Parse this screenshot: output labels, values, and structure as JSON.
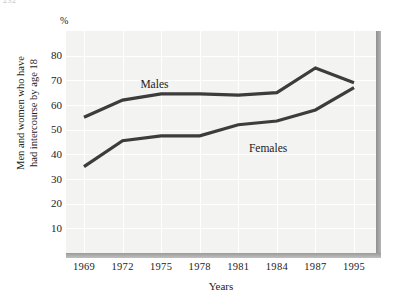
{
  "page": {
    "number": "232"
  },
  "chart_data": {
    "type": "line",
    "title": "",
    "subtitle": "",
    "xlabel": "Years",
    "ylabel": "Men and women who have had intercourse by age 18",
    "ylabel_line1": "Men and women who have",
    "ylabel_line2": "had intercourse by age 18",
    "unit_symbol": "%",
    "categories": [
      "1969",
      "1972",
      "1975",
      "1978",
      "1981",
      "1984",
      "1987",
      "1995"
    ],
    "x": [
      1969,
      1972,
      1975,
      1978,
      1981,
      1984,
      1987,
      1995
    ],
    "ylim": [
      0,
      90
    ],
    "yticks": [
      10,
      20,
      30,
      40,
      50,
      60,
      70,
      80
    ],
    "ytick_labels": [
      "10",
      "20",
      "30",
      "40",
      "50",
      "60",
      "70",
      "80"
    ],
    "grid": true,
    "legend": "inline-annotations",
    "series": [
      {
        "name": "Males",
        "label": "Males",
        "color": "#3c3c3c",
        "values": [
          55,
          62,
          64.5,
          64.5,
          64,
          65,
          75,
          69
        ],
        "annotation_x_pct": 24,
        "annotation_y_pct": 21
      },
      {
        "name": "Females",
        "label": "Females",
        "color": "#3c3c3c",
        "values": [
          35,
          45.5,
          47.5,
          47.5,
          52,
          53.5,
          58,
          67
        ],
        "annotation_x_pct": 59,
        "annotation_y_pct": 50
      }
    ],
    "colors": {
      "line": "#3c3c3c",
      "panel_background": "#f3f3f1",
      "gridline": "#ffffff",
      "axis_bar": "#9a9a9a",
      "page_background": "#ffffff",
      "text": "#1a1a1a"
    }
  }
}
